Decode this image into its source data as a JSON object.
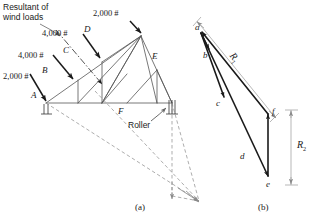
{
  "figure": {
    "title_caption_left": "(a)",
    "title_caption_right": "(b)",
    "colors": {
      "ink": "#1a1a1a",
      "member_line": "#555555",
      "dashed_line": "#8a8a8a",
      "background": "#ffffff"
    }
  },
  "truss_diagram": {
    "annotation_resultant": "Resultant of\nwind loads",
    "annotation_resultant_line1": "Resultant of",
    "annotation_resultant_line2": "wind loads",
    "roller_label": "Roller",
    "loads": [
      {
        "id": "load-top",
        "value": "2,000 #",
        "joint": "D-apex"
      },
      {
        "id": "load-upper-mid",
        "value": "4,000 #",
        "joint": "D"
      },
      {
        "id": "load-lower-mid",
        "value": "4,000 #",
        "joint": "C"
      },
      {
        "id": "load-bottom",
        "value": "2,000 #",
        "joint": "B"
      }
    ],
    "joint_labels": [
      {
        "id": "space-A",
        "label": "A"
      },
      {
        "id": "space-B",
        "label": "B"
      },
      {
        "id": "space-C",
        "label": "C"
      },
      {
        "id": "space-D",
        "label": "D"
      },
      {
        "id": "space-E",
        "label": "E"
      },
      {
        "id": "space-F",
        "label": "F"
      }
    ]
  },
  "force_polygon": {
    "vertex_labels": [
      {
        "id": "vertex-a",
        "label": "a"
      },
      {
        "id": "vertex-b",
        "label": "b"
      },
      {
        "id": "vertex-c",
        "label": "c"
      },
      {
        "id": "vertex-d",
        "label": "d"
      },
      {
        "id": "vertex-e",
        "label": "e"
      },
      {
        "id": "vertex-f",
        "label": "f"
      }
    ],
    "reactions": [
      {
        "id": "reaction-1",
        "label": "R",
        "subscript": "1"
      },
      {
        "id": "reaction-2",
        "label": "R",
        "subscript": "2"
      }
    ]
  }
}
